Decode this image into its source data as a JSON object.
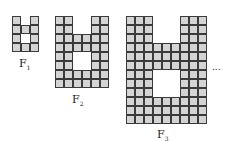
{
  "figures": [
    {
      "name": "F",
      "sub": "1",
      "n": 1,
      "x": 12,
      "y": 16,
      "label_x": 19,
      "label_y": 57
    },
    {
      "name": "F",
      "sub": "2",
      "n": 2,
      "x": 55,
      "y": 16,
      "label_x": 72,
      "label_y": 93
    },
    {
      "name": "F",
      "sub": "3",
      "n": 3,
      "x": 126,
      "y": 16,
      "label_x": 157,
      "label_y": 128
    }
  ],
  "ellipsis": "...",
  "colors": {
    "cell_fill": "#d4d4d4",
    "cell_border": "#3a3a3a"
  }
}
